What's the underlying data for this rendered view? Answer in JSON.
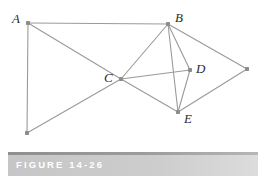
{
  "figure": {
    "caption": "FIGURE 14-26",
    "width": 265,
    "height": 183,
    "background_color": "#ffffff",
    "edge_color": "#9a9a9a",
    "vertex_color": "#8c8c8c",
    "label_color": "#2b2b2b",
    "caption_band_color": "#c8c8c8",
    "caption_rule_color": "#9a9a9a",
    "caption_text_color": "#ffffff"
  },
  "graph": {
    "type": "undirected-graph-diagram",
    "vertices": [
      {
        "id": "A",
        "label": "A",
        "x": 28,
        "y": 23,
        "label_x": 12,
        "label_y": 12,
        "labeled": true
      },
      {
        "id": "B",
        "label": "B",
        "x": 168,
        "y": 24,
        "label_x": 175,
        "label_y": 11,
        "labeled": true
      },
      {
        "id": "C",
        "label": "C",
        "x": 121,
        "y": 79,
        "label_x": 104,
        "label_y": 71,
        "labeled": true
      },
      {
        "id": "D",
        "label": "D",
        "x": 190,
        "y": 70,
        "label_x": 196,
        "label_y": 62,
        "labeled": true
      },
      {
        "id": "E",
        "label": "E",
        "x": 178,
        "y": 112,
        "label_x": 184,
        "label_y": 112,
        "labeled": true
      },
      {
        "id": "F",
        "label": "",
        "x": 247,
        "y": 69,
        "label_x": 0,
        "label_y": 0,
        "labeled": false
      },
      {
        "id": "G",
        "label": "",
        "x": 27,
        "y": 133,
        "label_x": 0,
        "label_y": 0,
        "labeled": false
      }
    ],
    "edges": [
      {
        "from": "A",
        "to": "B"
      },
      {
        "from": "A",
        "to": "G"
      },
      {
        "from": "A",
        "to": "C"
      },
      {
        "from": "C",
        "to": "B"
      },
      {
        "from": "C",
        "to": "D"
      },
      {
        "from": "C",
        "to": "G"
      },
      {
        "from": "C",
        "to": "E"
      },
      {
        "from": "B",
        "to": "D"
      },
      {
        "from": "B",
        "to": "E"
      },
      {
        "from": "B",
        "to": "F"
      },
      {
        "from": "D",
        "to": "E"
      },
      {
        "from": "E",
        "to": "F"
      }
    ]
  }
}
